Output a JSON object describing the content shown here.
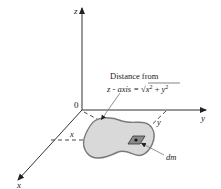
{
  "diagram": {
    "axes": {
      "z_label": "z",
      "y_label": "y",
      "x_label": "x",
      "origin_label": "0"
    },
    "annotation": {
      "line1": "Distance from",
      "line2_prefix": "z - axis = ",
      "sqrt_symbol": "√",
      "x_var": "x",
      "x_exp": "2",
      "plus": " + ",
      "y_var": "y",
      "y_exp": "2"
    },
    "projection_labels": {
      "x": "x",
      "y": "y"
    },
    "element_label": "dm",
    "colors": {
      "axis": "#333333",
      "body_fill": "#d9d9d9",
      "body_stroke": "#7a7a7a",
      "element_fill": "#888888"
    }
  }
}
